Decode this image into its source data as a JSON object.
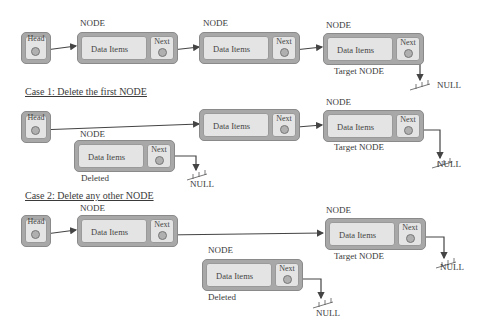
{
  "labels": {
    "node": "NODE",
    "head": "Head",
    "data_items": "Data Items",
    "next": "Next",
    "null": "NULL",
    "target": "Target NODE",
    "deleted": "Deleted"
  },
  "cases": {
    "case1_title": "Case 1: Delete the first NODE",
    "case2_title": "Case 2: Delete any other NODE"
  },
  "colors": {
    "outer": "#a8a8a8",
    "inner": "#e4e4e4",
    "line": "#444444"
  }
}
